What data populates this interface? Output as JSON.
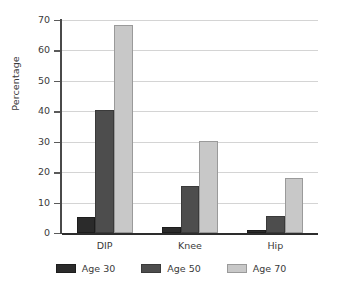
{
  "chart_data": {
    "type": "bar",
    "title": "",
    "subtitle": "",
    "xlabel": "",
    "ylabel": "Percentage",
    "categories": [
      "DIP",
      "Knee",
      "Hip"
    ],
    "series": [
      {
        "name": "Age 30",
        "color": "#2b2b2b",
        "values": [
          5.3,
          2.0,
          1.0
        ]
      },
      {
        "name": "Age 50",
        "color": "#4d4d4d",
        "values": [
          40.3,
          15.3,
          5.5
        ]
      },
      {
        "name": "Age 70",
        "color": "#c8c8c8",
        "values": [
          68.5,
          30.3,
          18.2
        ]
      }
    ],
    "ylim": [
      0,
      70
    ],
    "yticks": [
      0,
      10,
      20,
      30,
      40,
      50,
      60,
      70
    ],
    "ytick_labels": [
      "0",
      "10",
      "20",
      "30",
      "40",
      "50",
      "60",
      "70"
    ],
    "grid": true,
    "grid_axis": "y",
    "legend_position": "bottom",
    "bar_group_gap": 0.34,
    "colors": {
      "gridline": "#d4d4d4",
      "axis": "#4a4a4a",
      "baseline": "#2d2d2d",
      "text": "#3a3a3a",
      "background": "#ffffff"
    }
  }
}
